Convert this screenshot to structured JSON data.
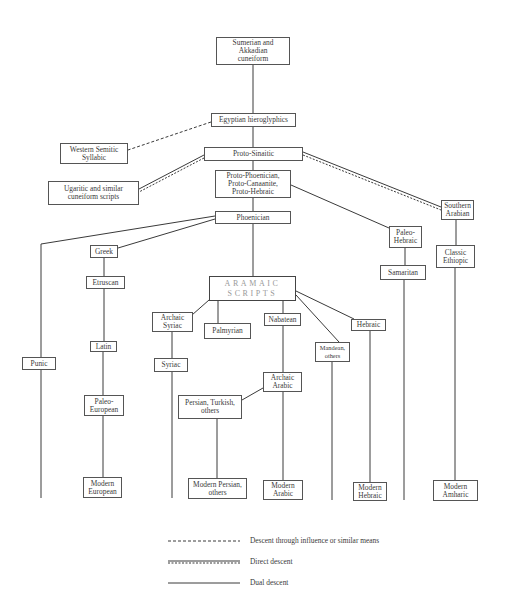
{
  "diagram": {
    "nodes": [
      {
        "id": "sumerian",
        "label": "Sumerian and Akkadian cuneiform",
        "lines": [
          "Sumerian and",
          "Akkadian",
          "cuneiform"
        ]
      },
      {
        "id": "egyptian",
        "label": "Egyptian hieroglyphics",
        "lines": [
          "Egyptian hieroglyphics"
        ]
      },
      {
        "id": "western_semitic",
        "label": "Western Semitic Syllabic",
        "lines": [
          "Western Semitic",
          "Syllabic"
        ]
      },
      {
        "id": "proto_sinaitic",
        "label": "Proto-Sinaitic",
        "lines": [
          "Proto-Sinaitic"
        ]
      },
      {
        "id": "ugaritic",
        "label": "Ugaritic and similar cuneiform scripts",
        "lines": [
          "Ugaritic and similar",
          "cuneiform scripts"
        ]
      },
      {
        "id": "proto_phoenician",
        "label": "Proto-Phoenician, Proto-Canaanite, Proto-Hebraic",
        "lines": [
          "Proto-Phoenician,",
          "Proto-Canaanite,",
          "Proto-Hebraic"
        ]
      },
      {
        "id": "phoenician",
        "label": "Phoenician",
        "lines": [
          "Phoenician"
        ]
      },
      {
        "id": "southern_arabian",
        "label": "Southern Arabian",
        "lines": [
          "Southern",
          "Arabian"
        ]
      },
      {
        "id": "paleo_hebraic",
        "label": "Paleo-Hebraic",
        "lines": [
          "Paleo-",
          "Hebraic"
        ]
      },
      {
        "id": "classic_ethiopic",
        "label": "Classic Ethiopic",
        "lines": [
          "Classic",
          "Ethiopic"
        ]
      },
      {
        "id": "samaritan",
        "label": "Samaritan",
        "lines": [
          "Samaritan"
        ]
      },
      {
        "id": "greek",
        "label": "Greek",
        "lines": [
          "Greek"
        ]
      },
      {
        "id": "etruscan",
        "label": "Etruscan",
        "lines": [
          "Etruscan"
        ]
      },
      {
        "id": "aramaic",
        "label": "ARAMAIC SCRIPTS",
        "lines": [
          "ARAMAIC",
          "SCRIPTS"
        ]
      },
      {
        "id": "archaic_syriac",
        "label": "Archaic Syriac",
        "lines": [
          "Archaic",
          "Syriac"
        ]
      },
      {
        "id": "palmyrian",
        "label": "Palmyrian",
        "lines": [
          "Palmyrian"
        ]
      },
      {
        "id": "nabatean",
        "label": "Nabatean",
        "lines": [
          "Nabatean"
        ]
      },
      {
        "id": "hebraic",
        "label": "Hebraic",
        "lines": [
          "Hebraic"
        ]
      },
      {
        "id": "mandean",
        "label": "Mandean, others",
        "lines": [
          "Mandean,",
          "others"
        ]
      },
      {
        "id": "latin",
        "label": "Latin",
        "lines": [
          "Latin"
        ]
      },
      {
        "id": "punic",
        "label": "Punic",
        "lines": [
          "Punic"
        ]
      },
      {
        "id": "syriac",
        "label": "Syriac",
        "lines": [
          "Syriac"
        ]
      },
      {
        "id": "archaic_arabic",
        "label": "Archaic Arabic",
        "lines": [
          "Archaic",
          "Arabic"
        ]
      },
      {
        "id": "persian_turkish",
        "label": "Persian, Turkish, others",
        "lines": [
          "Persian, Turkish,",
          "others"
        ]
      },
      {
        "id": "paleo_european",
        "label": "Paleo-European",
        "lines": [
          "Paleo-",
          "European"
        ]
      },
      {
        "id": "modern_european",
        "label": "Modern European",
        "lines": [
          "Modern",
          "European"
        ]
      },
      {
        "id": "modern_persian",
        "label": "Modern Persian, others",
        "lines": [
          "Modern Persian,",
          "others"
        ]
      },
      {
        "id": "modern_arabic",
        "label": "Modern Arabic",
        "lines": [
          "Modern",
          "Arabic"
        ]
      },
      {
        "id": "modern_hebraic",
        "label": "Modern Hebraic",
        "lines": [
          "Modern",
          "Hebraic"
        ]
      },
      {
        "id": "modern_amharic",
        "label": "Modern Amharic",
        "lines": [
          "Modern",
          "Amharic"
        ]
      }
    ],
    "edges": [
      {
        "from": "sumerian",
        "to": "egyptian",
        "style": "solid"
      },
      {
        "from": "egyptian",
        "to": "western_semitic",
        "style": "dashed"
      },
      {
        "from": "egyptian",
        "to": "proto_sinaitic",
        "style": "solid"
      },
      {
        "from": "proto_sinaitic",
        "to": "ugaritic",
        "style": "double"
      },
      {
        "from": "proto_sinaitic",
        "to": "southern_arabian",
        "style": "double"
      },
      {
        "from": "proto_sinaitic",
        "to": "proto_phoenician",
        "style": "solid"
      },
      {
        "from": "proto_phoenician",
        "to": "phoenician",
        "style": "solid"
      },
      {
        "from": "proto_phoenician",
        "to": "paleo_hebraic",
        "style": "solid"
      },
      {
        "from": "phoenician",
        "to": "punic",
        "style": "solid"
      },
      {
        "from": "phoenician",
        "to": "greek",
        "style": "solid"
      },
      {
        "from": "phoenician",
        "to": "aramaic",
        "style": "solid"
      },
      {
        "from": "southern_arabian",
        "to": "classic_ethiopic",
        "style": "solid"
      },
      {
        "from": "classic_ethiopic",
        "to": "modern_amharic",
        "style": "solid"
      },
      {
        "from": "paleo_hebraic",
        "to": "samaritan",
        "style": "solid"
      },
      {
        "from": "greek",
        "to": "etruscan",
        "style": "solid"
      },
      {
        "from": "etruscan",
        "to": "latin",
        "style": "solid"
      },
      {
        "from": "latin",
        "to": "paleo_european",
        "style": "solid"
      },
      {
        "from": "paleo_european",
        "to": "modern_european",
        "style": "solid"
      },
      {
        "from": "aramaic",
        "to": "archaic_syriac",
        "style": "solid"
      },
      {
        "from": "aramaic",
        "to": "palmyrian",
        "style": "solid"
      },
      {
        "from": "aramaic",
        "to": "nabatean",
        "style": "solid"
      },
      {
        "from": "aramaic",
        "to": "mandean",
        "style": "solid"
      },
      {
        "from": "aramaic",
        "to": "hebraic",
        "style": "solid"
      },
      {
        "from": "archaic_syriac",
        "to": "syriac",
        "style": "solid"
      },
      {
        "from": "nabatean",
        "to": "archaic_arabic",
        "style": "solid"
      },
      {
        "from": "archaic_arabic",
        "to": "persian_turkish",
        "style": "solid"
      },
      {
        "from": "archaic_arabic",
        "to": "modern_arabic",
        "style": "solid"
      },
      {
        "from": "persian_turkish",
        "to": "modern_persian",
        "style": "solid"
      },
      {
        "from": "hebraic",
        "to": "modern_hebraic",
        "style": "solid"
      }
    ]
  },
  "legend": {
    "items": [
      {
        "style": "dashed",
        "label": "Descent through influence or similar means"
      },
      {
        "style": "double",
        "label": "Direct descent"
      },
      {
        "style": "solid",
        "label": "Dual descent"
      }
    ]
  },
  "colors": {
    "line": "#3a3a3a",
    "box_border": "#555555",
    "text": "#3a3a3a",
    "aramaic_text": "#9a9a9a",
    "background": "#ffffff"
  }
}
